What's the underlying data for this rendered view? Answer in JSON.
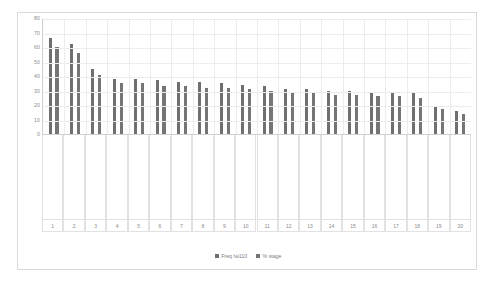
{
  "chart_data": {
    "type": "bar",
    "title": "",
    "xlabel": "",
    "ylabel": "",
    "ylim": [
      0,
      80
    ],
    "yticks": [
      0,
      10,
      20,
      30,
      40,
      50,
      60,
      70,
      80
    ],
    "grid": true,
    "legend_position": "bottom",
    "indices": [
      "1",
      "2",
      "3",
      "4",
      "5",
      "6",
      "7",
      "8",
      "9",
      "10",
      "11",
      "12",
      "13",
      "14",
      "15",
      "16",
      "17",
      "18",
      "19",
      "20"
    ],
    "categories": [
      "Lack of Common Development",
      "Lack of Poor Architecture",
      "Lack of Reliability",
      "Lack of Development Issues",
      "Lack of Management Issues",
      "Lack of Environment",
      "Cost Issues",
      "Lack of use of Technology",
      "Lack of Knowledge for High Skilled Resources",
      "Lack of Privacy",
      "Tradition Co-located Models",
      "Lack of Assessment Issues",
      "Lack of Poor Scheduling",
      "Lack of Trust",
      "Communication Workflows",
      "Market expansion Growth",
      "Framework integration",
      "Lack of effectiveness",
      "Fault Tolerance",
      "Deliverance Issue"
    ],
    "series": [
      {
        "name": "Freq №110",
        "color": "#6f6f6f",
        "values": [
          66,
          62,
          45,
          38,
          38,
          37,
          36,
          36,
          35,
          34,
          33,
          31,
          31,
          30,
          30,
          29,
          29,
          28,
          19,
          16
        ]
      },
      {
        "name": "% stage",
        "color": "#757575",
        "values": [
          60,
          56,
          41,
          35,
          35,
          33,
          33,
          32,
          32,
          31,
          30,
          28,
          28,
          27,
          27,
          26,
          26,
          25,
          17,
          14
        ]
      }
    ]
  },
  "legend": {
    "items": [
      {
        "label": "Freq №110"
      },
      {
        "label": "% stage"
      }
    ]
  }
}
